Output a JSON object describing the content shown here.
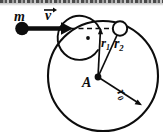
{
  "figure": {
    "type": "physics-diagram",
    "background_color": "#ffffff",
    "ink_color": "#0d0d0d",
    "width": 163,
    "height": 138
  },
  "labels": {
    "mass": "m",
    "velocity": "v",
    "radius_inner": "r",
    "radius_inner_sub": "1",
    "radius_particle": "r",
    "radius_particle_sub": "2",
    "center_point": "A",
    "radius_outer": "r",
    "radius_outer_sub": "0"
  },
  "geometry": {
    "circle": {
      "cx": 103,
      "cy": 76,
      "r": 55
    },
    "center_dot": {
      "cx": 98,
      "cy": 77,
      "r": 3
    },
    "mass_dot": {
      "cx": 22,
      "cy": 28,
      "r": 6.5
    },
    "velocity_line": {
      "x1": 22,
      "y1": 28,
      "x2": 64,
      "y2": 28
    },
    "velocity_arrow_tip": {
      "x": 72,
      "y": 28
    },
    "dashed_line": {
      "x1": 70,
      "y1": 28,
      "x2": 118,
      "y2": 28
    },
    "line_r1": {
      "x1": 98,
      "y1": 77,
      "x2": 101,
      "y2": 30
    },
    "line_r2": {
      "x1": 98,
      "y1": 77,
      "x2": 119,
      "y2": 31
    },
    "line_r0": {
      "x1": 98,
      "y1": 77,
      "x2": 140,
      "y2": 104
    },
    "particle_circle": {
      "cx": 120,
      "cy": 29,
      "r": 7
    },
    "angle_arc_radius": 22,
    "perpendicular_dot": {
      "cx": 88,
      "cy": 38,
      "r": 1.8
    }
  },
  "annotations": {
    "scan_artifact_top": true,
    "dashed_reference_line": true,
    "angle_arc_marker": true
  }
}
